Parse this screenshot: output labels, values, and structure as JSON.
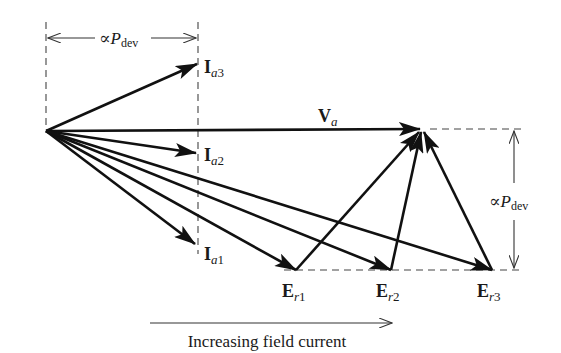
{
  "diagram": {
    "colors": {
      "ink": "#111111",
      "dashed": "#444444",
      "background": "#ffffff"
    },
    "origin": {
      "x": 46,
      "y": 131
    },
    "labels": {
      "top_dimension": {
        "prefix": "∝",
        "symbol": "P",
        "subscript": "dev"
      },
      "right_dimension": {
        "prefix": "∝",
        "symbol": "P",
        "subscript": "dev"
      },
      "Va": {
        "main": "V",
        "sub": "a"
      },
      "Ia3": {
        "main": "I",
        "sub": "a",
        "index": "3"
      },
      "Ia2": {
        "main": "I",
        "sub": "a",
        "index": "2"
      },
      "Ia1": {
        "main": "I",
        "sub": "a",
        "index": "1"
      },
      "Er1": {
        "main": "E",
        "sub": "r",
        "index": "1"
      },
      "Er2": {
        "main": "E",
        "sub": "r",
        "index": "2"
      },
      "Er3": {
        "main": "E",
        "sub": "r",
        "index": "3"
      },
      "field_current": "Increasing field current"
    },
    "vectors": [
      {
        "name": "Va",
        "from": [
          46,
          131
        ],
        "to": [
          420,
          129
        ]
      },
      {
        "name": "Ia3",
        "from": [
          46,
          131
        ],
        "to": [
          197,
          64
        ]
      },
      {
        "name": "Ia2",
        "from": [
          46,
          131
        ],
        "to": [
          196,
          153
        ]
      },
      {
        "name": "Ia1",
        "from": [
          46,
          131
        ],
        "to": [
          195,
          244
        ]
      },
      {
        "name": "Ea1",
        "from": [
          46,
          131
        ],
        "to": [
          296,
          270
        ]
      },
      {
        "name": "Ea2",
        "from": [
          46,
          131
        ],
        "to": [
          391,
          270
        ]
      },
      {
        "name": "Ea3",
        "from": [
          46,
          131
        ],
        "to": [
          492,
          270
        ]
      },
      {
        "name": "Er1",
        "from": [
          296,
          270
        ],
        "to": [
          420,
          131
        ]
      },
      {
        "name": "Er2",
        "from": [
          391,
          270
        ],
        "to": [
          421,
          131
        ]
      },
      {
        "name": "Er3",
        "from": [
          492,
          270
        ],
        "to": [
          423,
          131
        ]
      }
    ]
  }
}
